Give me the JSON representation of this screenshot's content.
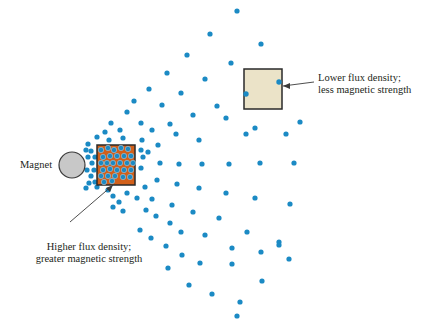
{
  "colors": {
    "dot": "#1b8ac4",
    "magnet_fill": "#c8c8c8",
    "magnet_stroke": "#3a3a3a",
    "high_square_fill": "#d2601a",
    "low_square_fill": "#ebe3c8",
    "square_stroke": "#2a2a2a",
    "text": "#231f20"
  },
  "labels": {
    "magnet": "Magnet",
    "high_line1": "Higher flux density;",
    "high_line2": "greater magnetic strength",
    "low_line1": "Lower flux density;",
    "low_line2": "less magnetic strength"
  },
  "magnet": {
    "cx": 72,
    "cy": 165,
    "r": 13
  },
  "high_square": {
    "x": 97,
    "y": 145,
    "w": 38,
    "h": 40
  },
  "low_square": {
    "x": 244,
    "y": 69,
    "w": 38,
    "h": 40
  },
  "dots_inside_high": [
    [
      101,
      150
    ],
    [
      108,
      148
    ],
    [
      114,
      150
    ],
    [
      121,
      148
    ],
    [
      128,
      149
    ],
    [
      103,
      157
    ],
    [
      110,
      156
    ],
    [
      117,
      156
    ],
    [
      124,
      156
    ],
    [
      131,
      156
    ],
    [
      101,
      163
    ],
    [
      107,
      163
    ],
    [
      113,
      163
    ],
    [
      120,
      163
    ],
    [
      127,
      163
    ],
    [
      133,
      163
    ],
    [
      103,
      170
    ],
    [
      110,
      169
    ],
    [
      117,
      170
    ],
    [
      124,
      170
    ],
    [
      131,
      170
    ],
    [
      101,
      176
    ],
    [
      108,
      176
    ],
    [
      115,
      176
    ],
    [
      123,
      177
    ],
    [
      130,
      177
    ],
    [
      104,
      182
    ],
    [
      112,
      181
    ]
  ],
  "dots_outside": [
    [
      237,
      11
    ],
    [
      210,
      34
    ],
    [
      261,
      44
    ],
    [
      187,
      55
    ],
    [
      231,
      63
    ],
    [
      167,
      73
    ],
    [
      205,
      79
    ],
    [
      149,
      89
    ],
    [
      181,
      93
    ],
    [
      217,
      106
    ],
    [
      134,
      101
    ],
    [
      162,
      105
    ],
    [
      193,
      115
    ],
    [
      127,
      112
    ],
    [
      111,
      123
    ],
    [
      141,
      123
    ],
    [
      170,
      124
    ],
    [
      226,
      118
    ],
    [
      246,
      134
    ],
    [
      300,
      122
    ],
    [
      105,
      132
    ],
    [
      120,
      130
    ],
    [
      152,
      130
    ],
    [
      176,
      134
    ],
    [
      199,
      140
    ],
    [
      255,
      128
    ],
    [
      286,
      134
    ],
    [
      97,
      137
    ],
    [
      109,
      140
    ],
    [
      123,
      138
    ],
    [
      142,
      140
    ],
    [
      158,
      145
    ],
    [
      141,
      150
    ],
    [
      148,
      152
    ],
    [
      88,
      144
    ],
    [
      91,
      151
    ],
    [
      95,
      157
    ],
    [
      92,
      163
    ],
    [
      94,
      170
    ],
    [
      91,
      176
    ],
    [
      95,
      182
    ],
    [
      97,
      187
    ],
    [
      86,
      150
    ],
    [
      88,
      157
    ],
    [
      87,
      170
    ],
    [
      89,
      183
    ],
    [
      86,
      188
    ],
    [
      143,
      157
    ],
    [
      160,
      163
    ],
    [
      179,
      164
    ],
    [
      202,
      164
    ],
    [
      229,
      164
    ],
    [
      260,
      163
    ],
    [
      294,
      163
    ],
    [
      141,
      168
    ],
    [
      157,
      180
    ],
    [
      177,
      184
    ],
    [
      199,
      188
    ],
    [
      226,
      193
    ],
    [
      255,
      198
    ],
    [
      290,
      204
    ],
    [
      145,
      187
    ],
    [
      108,
      190
    ],
    [
      113,
      196
    ],
    [
      119,
      202
    ],
    [
      127,
      193
    ],
    [
      137,
      198
    ],
    [
      152,
      199
    ],
    [
      172,
      205
    ],
    [
      193,
      212
    ],
    [
      219,
      218
    ],
    [
      247,
      232
    ],
    [
      279,
      242
    ],
    [
      113,
      207
    ],
    [
      123,
      211
    ],
    [
      146,
      210
    ],
    [
      156,
      216
    ],
    [
      170,
      223
    ],
    [
      181,
      232
    ],
    [
      205,
      235
    ],
    [
      232,
      248
    ],
    [
      261,
      252
    ],
    [
      279,
      245
    ],
    [
      140,
      230
    ],
    [
      151,
      238
    ],
    [
      166,
      246
    ],
    [
      182,
      255
    ],
    [
      200,
      263
    ],
    [
      232,
      264
    ],
    [
      168,
      268
    ],
    [
      189,
      285
    ],
    [
      212,
      294
    ],
    [
      240,
      302
    ],
    [
      237,
      316
    ],
    [
      262,
      281
    ],
    [
      289,
      259
    ]
  ],
  "dots_inside_low": [
    [
      279,
      82
    ],
    [
      246,
      94
    ]
  ]
}
